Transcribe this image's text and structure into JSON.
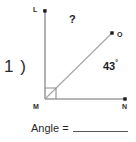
{
  "problem": {
    "number_label": "1 )"
  },
  "figure": {
    "type": "angle-diagram",
    "vertices": [
      {
        "name": "L",
        "label": "L",
        "x": 45,
        "y": 11,
        "role": "ray-endpoint-upper"
      },
      {
        "name": "O",
        "label": "O",
        "x": 112,
        "y": 33,
        "role": "ray-endpoint-diagonal"
      },
      {
        "name": "M",
        "label": "M",
        "x": 45,
        "y": 99,
        "role": "vertex"
      },
      {
        "name": "N",
        "label": "N",
        "x": 125,
        "y": 99,
        "role": "ray-endpoint-lower"
      }
    ],
    "rays": [
      {
        "from": "M",
        "to": "L"
      },
      {
        "from": "M",
        "to": "O"
      },
      {
        "from": "M",
        "to": "N"
      }
    ],
    "right_angle_marker": {
      "at": "M",
      "between": [
        "L",
        "N"
      ]
    },
    "angles": [
      {
        "name": "LMO",
        "label": "?",
        "known": false
      },
      {
        "name": "OMN",
        "label": "43",
        "degree_symbol": "°",
        "value": 43,
        "known": true
      }
    ],
    "colors": {
      "line": "#9a9a9a",
      "point": "#1a1a1a",
      "text": "#1d1d1d",
      "background": "#ffffff"
    }
  },
  "answer": {
    "label": "Angle =",
    "value": ""
  }
}
